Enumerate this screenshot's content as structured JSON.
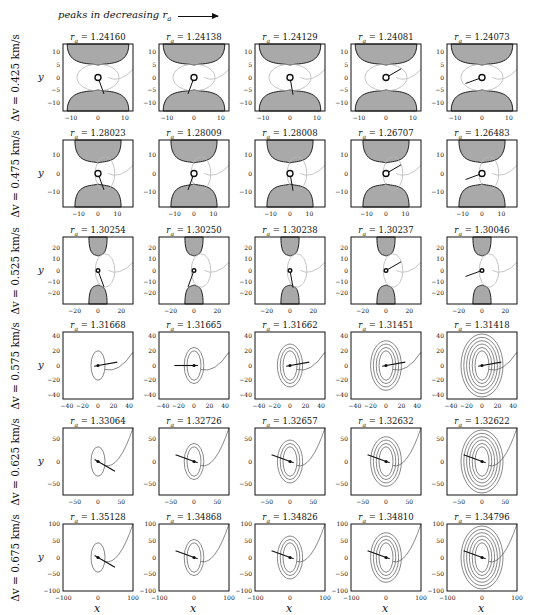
{
  "header": {
    "label": "peaks in decreasing r_a",
    "arrow": "right-arrow"
  },
  "chart_data": {
    "type": "line",
    "xlabel": "x",
    "ylabel": "y",
    "layout": {
      "rows": 6,
      "cols": 5,
      "grid": false,
      "legend": "none"
    },
    "rows": [
      {
        "label": "Δv = 0.425 km/s",
        "dv": 0.425,
        "axis_range": [
          -13,
          13
        ],
        "xticks": [
          -10,
          0,
          10
        ],
        "yticks": [
          -10,
          -5,
          0,
          5,
          10
        ],
        "panels": [
          {
            "r_a": "1.24160"
          },
          {
            "r_a": "1.24138"
          },
          {
            "r_a": "1.24129"
          },
          {
            "r_a": "1.24081"
          },
          {
            "r_a": "1.24073"
          }
        ]
      },
      {
        "label": "Δv = 0.475 km/s",
        "dv": 0.475,
        "axis_range": [
          -18,
          18
        ],
        "xticks": [
          -10,
          0,
          10
        ],
        "yticks": [
          -10,
          0,
          10
        ],
        "panels": [
          {
            "r_a": "1.28023"
          },
          {
            "r_a": "1.28009"
          },
          {
            "r_a": "1.28008"
          },
          {
            "r_a": "1.26707"
          },
          {
            "r_a": "1.26483"
          }
        ]
      },
      {
        "label": "Δv = 0.525 km/s",
        "dv": 0.525,
        "axis_range": [
          -30,
          30
        ],
        "xticks": [
          -20,
          0,
          20
        ],
        "yticks": [
          -20,
          -10,
          0,
          10,
          20
        ],
        "panels": [
          {
            "r_a": "1.30254"
          },
          {
            "r_a": "1.30250"
          },
          {
            "r_a": "1.30238"
          },
          {
            "r_a": "1.30237"
          },
          {
            "r_a": "1.30046"
          }
        ]
      },
      {
        "label": "Δv = 0.575 km/s",
        "dv": 0.575,
        "axis_range": [
          -45,
          45
        ],
        "xticks": [
          -40,
          -20,
          0,
          20,
          40
        ],
        "yticks": [
          -40,
          -20,
          0,
          20,
          40
        ],
        "panels": [
          {
            "r_a": "1.31668"
          },
          {
            "r_a": "1.31665"
          },
          {
            "r_a": "1.31662"
          },
          {
            "r_a": "1.31451"
          },
          {
            "r_a": "1.31418"
          }
        ]
      },
      {
        "label": "Δv = 0.625 km/s",
        "dv": 0.625,
        "axis_range": [
          -75,
          75
        ],
        "xticks": [
          -50,
          0,
          50
        ],
        "yticks": [
          -50,
          0,
          50
        ],
        "panels": [
          {
            "r_a": "1.33064"
          },
          {
            "r_a": "1.32726"
          },
          {
            "r_a": "1.32657"
          },
          {
            "r_a": "1.32632"
          },
          {
            "r_a": "1.32622"
          }
        ]
      },
      {
        "label": "Δv = 0.675 km/s",
        "dv": 0.675,
        "axis_range": [
          -100,
          100
        ],
        "xticks": [
          -100,
          0,
          100
        ],
        "yticks": [
          -100,
          -50,
          0,
          50,
          100
        ],
        "panels": [
          {
            "r_a": "1.35128"
          },
          {
            "r_a": "1.34868"
          },
          {
            "r_a": "1.34826"
          },
          {
            "r_a": "1.34810"
          },
          {
            "r_a": "1.34796"
          }
        ]
      }
    ]
  },
  "axis_labels": {
    "x": "x",
    "y": "y"
  },
  "colors": {
    "forbidden_region": "#a9a9a9",
    "trajectory_light": "#b8b8b8",
    "trajectory_dark": "#555555",
    "marker_line": "#111111"
  }
}
